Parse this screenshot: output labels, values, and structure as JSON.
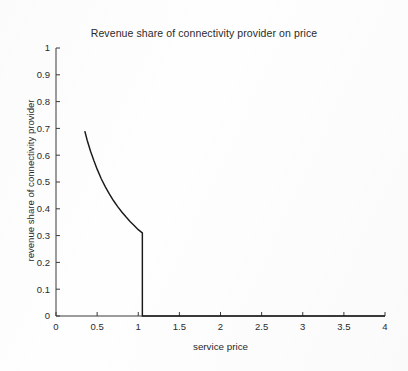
{
  "chart_data": {
    "type": "line",
    "title": "Revenue share of connectivity provider on price",
    "xlabel": "service price",
    "ylabel": "revenue share of connectivity provider",
    "xlim": [
      0,
      4
    ],
    "ylim": [
      0,
      1
    ],
    "xticks": [
      0,
      0.5,
      1,
      1.5,
      2,
      2.5,
      3,
      3.5,
      4
    ],
    "xticklabels": [
      "0",
      "0.5",
      "1",
      "1.5",
      "2",
      "2.5",
      "3",
      "3.5",
      "4"
    ],
    "yticks": [
      0,
      0.1,
      0.2,
      0.3,
      0.4,
      0.5,
      0.6,
      0.7,
      0.8,
      0.9,
      1
    ],
    "yticklabels": [
      "0",
      "0.1",
      "0.2",
      "0.3",
      "0.4",
      "0.5",
      "0.6",
      "0.7",
      "0.8",
      "0.9",
      "1"
    ],
    "grid": false,
    "legend": null,
    "line_color": "#1a1a1a",
    "series": [
      {
        "name": "revenue share of connectivity provider",
        "x": [
          0.35,
          0.38,
          0.42,
          0.46,
          0.5,
          0.55,
          0.6,
          0.65,
          0.7,
          0.75,
          0.8,
          0.85,
          0.9,
          0.95,
          1.0,
          1.03,
          1.05,
          1.05,
          1.1,
          1.5,
          2.0,
          2.5,
          3.0,
          3.5,
          4.0
        ],
        "y": [
          0.69,
          0.655,
          0.615,
          0.58,
          0.548,
          0.512,
          0.482,
          0.455,
          0.43,
          0.408,
          0.388,
          0.37,
          0.353,
          0.338,
          0.322,
          0.315,
          0.31,
          0.0,
          0.0,
          0.0,
          0.0,
          0.0,
          0.0,
          0.0,
          0.0
        ]
      }
    ],
    "annotations": {
      "curve_start": {
        "x": 0.35,
        "y": 0.69
      },
      "corner": {
        "x": 1.05,
        "y": 0.31
      },
      "drop_to_zero_at_x": 1.05
    }
  },
  "axes": {
    "x_axis_name": "service price axis",
    "y_axis_name": "revenue share axis"
  }
}
